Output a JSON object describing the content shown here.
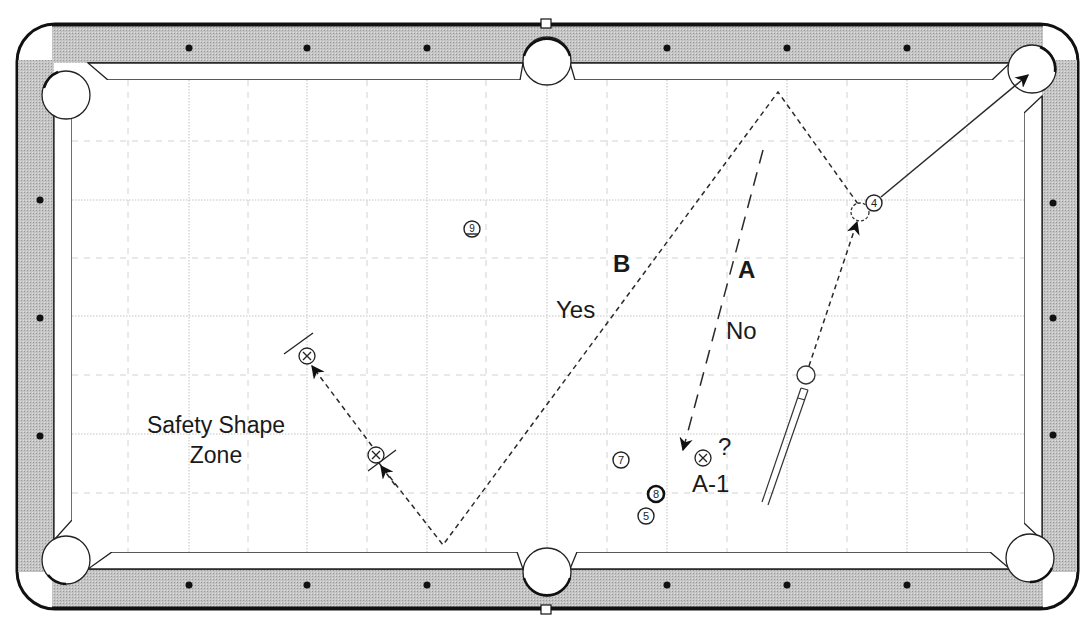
{
  "diagram": {
    "type": "pool-table-shot-diagram",
    "colors": {
      "rail": "#bdbdbd",
      "rail_edge": "#1a1a1a",
      "cloth": "#ffffff",
      "cushion": "#ffffff",
      "grid": "#c8c8c8",
      "line": "#333333",
      "diamond": "#111111"
    },
    "labels": {
      "route_b": "B",
      "route_b_answer": "Yes",
      "route_a": "A",
      "route_a_answer": "No",
      "target_question": "?",
      "target_label": "A-1",
      "zone_line1": "Safety Shape",
      "zone_line2": "Zone"
    },
    "balls": [
      {
        "id": "9",
        "label": "9",
        "x": 472,
        "y": 229
      },
      {
        "id": "4",
        "label": "4",
        "x": 874,
        "y": 203
      },
      {
        "id": "7",
        "label": "7",
        "x": 621,
        "y": 460
      },
      {
        "id": "8",
        "label": "8",
        "x": 656,
        "y": 494
      },
      {
        "id": "5",
        "label": "5",
        "x": 646,
        "y": 516
      }
    ],
    "cue_ball": {
      "x": 806,
      "y": 375
    },
    "ghost_ball": {
      "x": 860,
      "y": 212
    },
    "position_targets": [
      {
        "label": "X",
        "x": 307,
        "y": 356
      },
      {
        "label": "X",
        "x": 376,
        "y": 455
      },
      {
        "label": "X",
        "x": 703,
        "y": 458
      }
    ],
    "pockets": [
      "top-left",
      "top-center",
      "top-right",
      "bottom-left",
      "bottom-center",
      "bottom-right"
    ],
    "diamonds": {
      "top": [
        188,
        307,
        427,
        665,
        785,
        905
      ],
      "bottom": [
        188,
        307,
        427,
        665,
        785,
        905
      ],
      "left": [
        200,
        318,
        436
      ],
      "right": [
        203,
        318,
        435
      ]
    }
  }
}
